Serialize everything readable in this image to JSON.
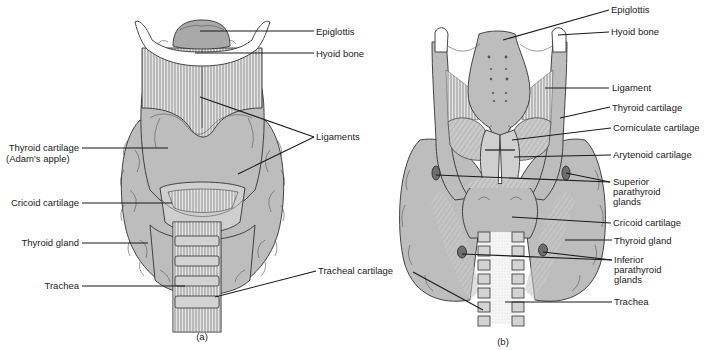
{
  "figure": {
    "panels": [
      {
        "id": "a",
        "caption": "(a)",
        "view": "anterior",
        "labels": {
          "epiglottis": "Epiglottis",
          "hyoid_bone": "Hyoid bone",
          "ligaments": "Ligaments",
          "thyroid_cartilage": "Thyroid cartilage",
          "thyroid_cartilage_sub": "(Adam's apple)",
          "cricoid_cartilage": "Cricoid cartilage",
          "thyroid_gland": "Thyroid gland",
          "trachea": "Trachea",
          "tracheal_cartilage": "Tracheal cartilage"
        }
      },
      {
        "id": "b",
        "caption": "(b)",
        "view": "posterior",
        "labels": {
          "epiglottis": "Epiglottis",
          "hyoid_bone": "Hyoid bone",
          "ligament": "Ligament",
          "thyroid_cartilage": "Thyroid cartilage",
          "corniculate_cartilage": "Corniculate cartilage",
          "arytenoid_cartilage": "Arytenoid cartilage",
          "superior_parathyroid": [
            "Superior",
            "parathyroid",
            "glands"
          ],
          "cricoid_cartilage": "Cricoid cartilage",
          "thyroid_gland": "Thyroid gland",
          "inferior_parathyroid": [
            "Inferior",
            "parathyroid",
            "glands"
          ],
          "trachea": "Trachea"
        }
      }
    ],
    "colors": {
      "tissue": "#bdbdbd",
      "bone": "#ffffff",
      "gland": "#6e6e6e",
      "line": "#1a1a1a",
      "text": "#222222"
    }
  }
}
